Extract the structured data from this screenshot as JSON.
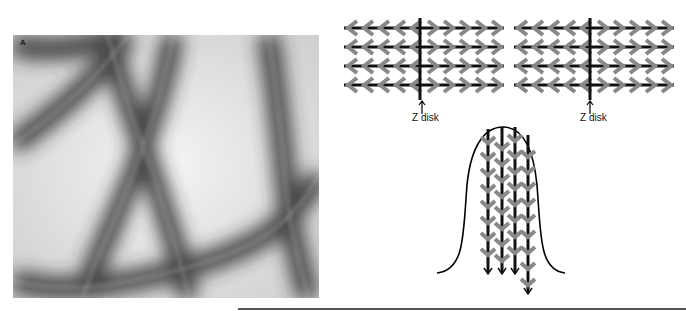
{
  "panel_a": {
    "label": "A",
    "description": "Electron micrograph of negatively stained actin filaments with bound myosin heads (arrowhead decoration)"
  },
  "diagram": {
    "sarcomere_left": {
      "z_label": "Z disk",
      "rows": 4
    },
    "sarcomere_right": {
      "z_label": "Z disk",
      "rows": 4
    },
    "microvillus": {
      "filaments": 4,
      "description": "filaments with arrowheads pointing down, barbed ends at tip"
    }
  },
  "colors": {
    "filament": "#111111",
    "arrowhead": "#888888",
    "outline": "#000000"
  }
}
